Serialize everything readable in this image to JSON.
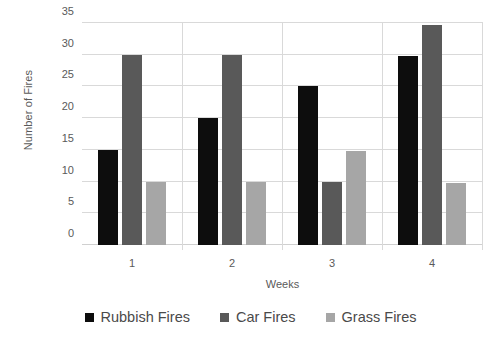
{
  "chart_data": {
    "type": "bar",
    "title": "",
    "xlabel": "Weeks",
    "ylabel": "Number of Fires",
    "categories": [
      "1",
      "2",
      "3",
      "4"
    ],
    "series": [
      {
        "name": "Rubbish Fires",
        "color": "#0d0d0d",
        "values": [
          15,
          20,
          25,
          29.8
        ]
      },
      {
        "name": "Car Fires",
        "color": "#595959",
        "values": [
          30,
          30,
          10,
          34.7
        ]
      },
      {
        "name": "Grass Fires",
        "color": "#a6a6a6",
        "values": [
          10,
          10,
          14.8,
          9.7
        ]
      }
    ],
    "ylim": [
      0,
      35
    ],
    "yticks": [
      0,
      5,
      10,
      15,
      20,
      25,
      30,
      35
    ],
    "ytick_labels": [
      "0",
      "5",
      "10",
      "15",
      "20",
      "25",
      "30",
      "35"
    ],
    "grid": true,
    "legend_position": "bottom"
  }
}
